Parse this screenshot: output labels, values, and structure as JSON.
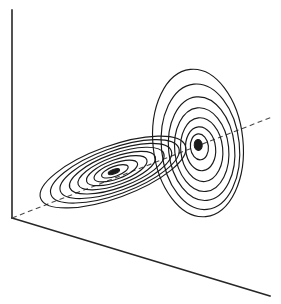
{
  "figure": {
    "title": "",
    "caption": "",
    "background_color": "#ffffff",
    "line_color": "#1a1a1a",
    "axis_color": "#262626",
    "dashed_axis_color": "#4a4a4a"
  },
  "axes": {
    "vertical_axis": {
      "name": "vertical-axis",
      "style": "solid",
      "x1": 12,
      "y1": 10,
      "x2": 12,
      "y2": 218
    },
    "floor_front_edge": {
      "name": "floor-front-edge",
      "style": "solid",
      "x1": 12,
      "y1": 218,
      "x2": 270,
      "y2": 296
    },
    "depth_axis": {
      "name": "depth-axis",
      "style": "dashed",
      "x1": 12,
      "y1": 218,
      "x2": 272,
      "y2": 117
    }
  },
  "chart_data": {
    "type": "contour",
    "title": "",
    "subtitle": "",
    "xlabel": "",
    "ylabel": "",
    "zlabel": "",
    "grid": false,
    "legend": null,
    "annotations": [],
    "projection": {
      "type": "oblique-3d-box",
      "planes": [
        "vertical-back-wall",
        "horizontal-floor"
      ]
    },
    "series": [
      {
        "name": "floor-contour-cluster",
        "plane": "horizontal-floor",
        "center": [
          113,
          172
        ],
        "rotation_deg": -20,
        "n_levels": 9,
        "levels": [
          0.1,
          0.2,
          0.3,
          0.4,
          0.5,
          0.6,
          0.7,
          0.8,
          0.9
        ],
        "semi_axes": [
          [
            77,
            26
          ],
          [
            68,
            23
          ],
          [
            59,
            20
          ],
          [
            50,
            17
          ],
          [
            41,
            14
          ],
          [
            32,
            11
          ],
          [
            23,
            8
          ],
          [
            14,
            5
          ],
          [
            6,
            2.2
          ]
        ],
        "bbox": [
          36,
          138,
          190,
          210
        ]
      },
      {
        "name": "wall-contour-cluster",
        "plane": "vertical-back-wall",
        "center": [
          198,
          143
        ],
        "rotation_deg": -6,
        "n_levels": 8,
        "levels": [
          0.1,
          0.2,
          0.3,
          0.4,
          0.5,
          0.6,
          0.7,
          0.8
        ],
        "semi_axes": [
          [
            45,
            74
          ],
          [
            39,
            63
          ],
          [
            33,
            52
          ],
          [
            27,
            42
          ],
          [
            21,
            32
          ],
          [
            15,
            22
          ],
          [
            9,
            13
          ],
          [
            4,
            5.5
          ]
        ],
        "bbox": [
          153,
          69,
          243,
          217
        ]
      }
    ]
  }
}
